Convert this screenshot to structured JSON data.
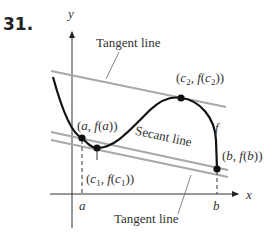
{
  "figure": {
    "problem_number": "31.",
    "axes": {
      "x_label": "x",
      "y_label": "y"
    },
    "labels": {
      "tangent_top": "Tangent line",
      "tangent_bottom": "Tangent line",
      "secant": "Secant line",
      "function": "f",
      "tick_a": "a",
      "tick_b": "b"
    },
    "points": [
      {
        "id": "a",
        "label": "(a, f(a))"
      },
      {
        "id": "c1",
        "label": "(c1, f(c1))"
      },
      {
        "id": "c2",
        "label": "(c2, f(c2))"
      },
      {
        "id": "b",
        "label": "(b, f(b))"
      }
    ],
    "colors": {
      "curve": "#111111",
      "lines": "#a8a8a8",
      "axes": "#333333"
    }
  }
}
